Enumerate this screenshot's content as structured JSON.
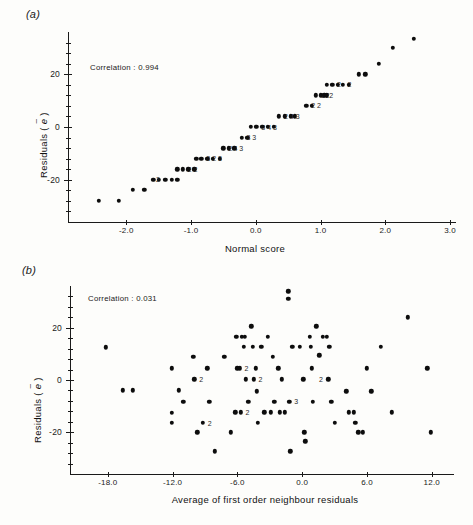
{
  "figure": {
    "background": "#fdfdfb",
    "ink": "#0d0d0d"
  },
  "panel_a": {
    "letter": "(a)",
    "annotation": "Correlation : 0.994",
    "xlabel": "Normal score",
    "ylabel_prefix": "Residuals ( ",
    "ylabel_symbol": "e",
    "ylabel_suffix": " )",
    "xticks": [
      "-2.0",
      "-1.0",
      "0.0",
      "1.0",
      "2.0",
      "3.0"
    ],
    "yticks": [
      "20",
      "0",
      "-20"
    ]
  },
  "panel_b": {
    "letter": "(b)",
    "annotation": "Correlation : 0.031",
    "xlabel": "Average of first order neighbour residuals",
    "ylabel_prefix": "Residuals ( ",
    "ylabel_symbol": "e",
    "ylabel_suffix": " )",
    "xticks": [
      "-18.0",
      "-12.0",
      "-6.0",
      "0.0",
      "6.0",
      "12.0"
    ],
    "yticks": [
      "20",
      "0",
      "-20"
    ]
  },
  "chart_data": [
    {
      "id": "panel-a",
      "type": "scatter",
      "title": "(a)",
      "xlabel": "Normal score",
      "ylabel": "Residuals (e-tilde)",
      "annotation": "Correlation : 0.994",
      "xlim": [
        -2.9,
        3.0
      ],
      "ylim": [
        -36,
        36
      ],
      "xticks": [
        -2.0,
        -1.0,
        0.0,
        1.0,
        2.0,
        3.0
      ],
      "yticks": [
        20,
        0,
        -20
      ],
      "ytick_minor_step": 4,
      "grid": false,
      "legend": null,
      "description": "Normal probability plot of residuals; points lie on a near straight line. Numeric labels beside points denote multiplicity of overplotted observations.",
      "points": [
        {
          "x": -2.42,
          "y": -28.0,
          "n": 1
        },
        {
          "x": -2.12,
          "y": -28.0,
          "n": 1
        },
        {
          "x": -1.9,
          "y": -23.8,
          "n": 1
        },
        {
          "x": -1.72,
          "y": -23.8,
          "n": 1
        },
        {
          "x": -1.58,
          "y": -20.0,
          "n": 1
        },
        {
          "x": -1.5,
          "y": -20.0,
          "n": 1
        },
        {
          "x": -1.4,
          "y": -20.0,
          "n": 2,
          "label": "2",
          "label_side": "left"
        },
        {
          "x": -1.3,
          "y": -20.0,
          "n": 1
        },
        {
          "x": -1.21,
          "y": -20.0,
          "n": 1
        },
        {
          "x": -1.21,
          "y": -16.0,
          "n": 1
        },
        {
          "x": -1.13,
          "y": -16.0,
          "n": 2,
          "label": "2",
          "label_side": "right"
        },
        {
          "x": -1.04,
          "y": -16.0,
          "n": 2,
          "label": "2",
          "label_side": "right"
        },
        {
          "x": -0.95,
          "y": -16.0,
          "n": 1
        },
        {
          "x": -0.92,
          "y": -12.0,
          "n": 1
        },
        {
          "x": -0.84,
          "y": -12.0,
          "n": 3,
          "label": "3",
          "label_side": "right"
        },
        {
          "x": -0.75,
          "y": -12.0,
          "n": 2,
          "label": "2",
          "label_side": "right"
        },
        {
          "x": -0.66,
          "y": -12.0,
          "n": 3,
          "label": "3",
          "label_side": "right"
        },
        {
          "x": -0.56,
          "y": -12.0,
          "n": 1
        },
        {
          "x": -0.5,
          "y": -8.0,
          "n": 2,
          "label": "2",
          "label_side": "right"
        },
        {
          "x": -0.42,
          "y": -8.0,
          "n": 4,
          "label": "4",
          "label_side": "right"
        },
        {
          "x": -0.33,
          "y": -8.0,
          "n": 3,
          "label": "3",
          "label_side": "right"
        },
        {
          "x": -0.22,
          "y": -4.0,
          "n": 3,
          "label": "3",
          "label_side": "right"
        },
        {
          "x": -0.13,
          "y": -4.0,
          "n": 3,
          "label": "3",
          "label_side": "right"
        },
        {
          "x": -0.08,
          "y": 0.0,
          "n": 1
        },
        {
          "x": 0.01,
          "y": 0.0,
          "n": 3,
          "label": "3",
          "label_side": "right"
        },
        {
          "x": 0.1,
          "y": 0.0,
          "n": 4,
          "label": "4",
          "label_side": "right"
        },
        {
          "x": 0.19,
          "y": 0.0,
          "n": 3,
          "label": "3",
          "label_side": "right"
        },
        {
          "x": 0.28,
          "y": 0.0,
          "n": 1
        },
        {
          "x": 0.36,
          "y": 4.0,
          "n": 2,
          "label": "2",
          "label_side": "right"
        },
        {
          "x": 0.45,
          "y": 4.0,
          "n": 4,
          "label": "4",
          "label_side": "right"
        },
        {
          "x": 0.54,
          "y": 4.0,
          "n": 3,
          "label": "3",
          "label_side": "right"
        },
        {
          "x": 0.6,
          "y": 4.0,
          "n": 1
        },
        {
          "x": 0.78,
          "y": 8.0,
          "n": 2,
          "label": "2",
          "label_side": "right"
        },
        {
          "x": 0.87,
          "y": 8.0,
          "n": 2,
          "label": "2",
          "label_side": "right"
        },
        {
          "x": 0.93,
          "y": 12.0,
          "n": 3,
          "label": "3",
          "label_side": "right"
        },
        {
          "x": 1.0,
          "y": 12.0,
          "n": 2,
          "label": "2",
          "label_side": "right"
        },
        {
          "x": 1.06,
          "y": 12.0,
          "n": 2,
          "label": "2",
          "label_side": "right"
        },
        {
          "x": 1.1,
          "y": 12.0,
          "n": 1
        },
        {
          "x": 1.1,
          "y": 16.0,
          "n": 1
        },
        {
          "x": 1.18,
          "y": 16.0,
          "n": 2,
          "label": "2",
          "label_side": "right"
        },
        {
          "x": 1.27,
          "y": 16.0,
          "n": 1
        },
        {
          "x": 1.34,
          "y": 16.0,
          "n": 2,
          "label": "2",
          "label_side": "right"
        },
        {
          "x": 1.44,
          "y": 16.0,
          "n": 1
        },
        {
          "x": 1.59,
          "y": 20.0,
          "n": 1
        },
        {
          "x": 1.69,
          "y": 20.0,
          "n": 1
        },
        {
          "x": 1.9,
          "y": 24.0,
          "n": 1
        },
        {
          "x": 2.12,
          "y": 30.0,
          "n": 1
        },
        {
          "x": 2.44,
          "y": 33.5,
          "n": 1
        }
      ]
    },
    {
      "id": "panel-b",
      "type": "scatter",
      "title": "(b)",
      "xlabel": "Average of first order neighbour residuals",
      "ylabel": "Residuals (e-tilde)",
      "annotation": "Correlation : 0.031",
      "xlim": [
        -21.5,
        13.5
      ],
      "ylim": [
        -36,
        36
      ],
      "xticks": [
        -18.0,
        -12.0,
        -6.0,
        0.0,
        6.0,
        12.0
      ],
      "yticks": [
        20,
        0,
        -20
      ],
      "ytick_minor_step": 4,
      "grid": false,
      "legend": null,
      "description": "Residuals against average of first order neighbour residuals; no apparent trend. Numeric labels beside points denote multiplicity of overplotted observations.",
      "points": [
        {
          "x": -18.2,
          "y": 12.5,
          "n": 1
        },
        {
          "x": -16.6,
          "y": -4.0,
          "n": 1
        },
        {
          "x": -15.7,
          "y": -4.0,
          "n": 1
        },
        {
          "x": -12.1,
          "y": 4.5,
          "n": 1
        },
        {
          "x": -12.1,
          "y": -12.5,
          "n": 1
        },
        {
          "x": -12.1,
          "y": -16.5,
          "n": 1
        },
        {
          "x": -11.4,
          "y": -4.0,
          "n": 1
        },
        {
          "x": -11.0,
          "y": -8.3,
          "n": 1
        },
        {
          "x": -10.1,
          "y": 8.8,
          "n": 1
        },
        {
          "x": -10.0,
          "y": 0.3,
          "n": 2,
          "label": "2",
          "label_side": "right"
        },
        {
          "x": -9.7,
          "y": -20.0,
          "n": 1
        },
        {
          "x": -9.2,
          "y": -16.5,
          "n": 2,
          "label": "2",
          "label_side": "right"
        },
        {
          "x": -8.8,
          "y": 4.5,
          "n": 1
        },
        {
          "x": -8.6,
          "y": -8.3,
          "n": 1
        },
        {
          "x": -8.1,
          "y": -27.3,
          "n": 1
        },
        {
          "x": -7.2,
          "y": 8.8,
          "n": 1
        },
        {
          "x": -6.6,
          "y": -20.0,
          "n": 1
        },
        {
          "x": -6.2,
          "y": -12.3,
          "n": 1
        },
        {
          "x": -6.1,
          "y": 16.5,
          "n": 1
        },
        {
          "x": -6.0,
          "y": 4.5,
          "n": 1
        },
        {
          "x": -5.8,
          "y": 4.5,
          "n": 2,
          "label": "2",
          "label_side": "right"
        },
        {
          "x": -5.7,
          "y": -12.3,
          "n": 2,
          "label": "2",
          "label_side": "right"
        },
        {
          "x": -5.6,
          "y": 16.5,
          "n": 1
        },
        {
          "x": -5.4,
          "y": 12.8,
          "n": 1
        },
        {
          "x": -5.3,
          "y": 16.5,
          "n": 1
        },
        {
          "x": -5.2,
          "y": 0.3,
          "n": 1
        },
        {
          "x": -5.0,
          "y": -8.3,
          "n": 1
        },
        {
          "x": -4.7,
          "y": 20.5,
          "n": 1
        },
        {
          "x": -4.6,
          "y": 12.8,
          "n": 1
        },
        {
          "x": -4.5,
          "y": 0.3,
          "n": 2,
          "label": "2",
          "label_side": "right"
        },
        {
          "x": -4.3,
          "y": 4.5,
          "n": 1
        },
        {
          "x": -4.2,
          "y": -4.3,
          "n": 1
        },
        {
          "x": -4.1,
          "y": -16.5,
          "n": 1
        },
        {
          "x": -3.8,
          "y": 12.8,
          "n": 1
        },
        {
          "x": -3.5,
          "y": -12.3,
          "n": 1
        },
        {
          "x": -3.2,
          "y": 16.5,
          "n": 1
        },
        {
          "x": -2.9,
          "y": -12.3,
          "n": 1
        },
        {
          "x": -2.7,
          "y": 8.8,
          "n": 1
        },
        {
          "x": -2.6,
          "y": -8.3,
          "n": 1
        },
        {
          "x": -2.2,
          "y": 4.5,
          "n": 1
        },
        {
          "x": -2.1,
          "y": -12.3,
          "n": 1
        },
        {
          "x": -1.9,
          "y": 0.3,
          "n": 1
        },
        {
          "x": -1.6,
          "y": -12.3,
          "n": 1
        },
        {
          "x": -1.3,
          "y": 34.0,
          "n": 1
        },
        {
          "x": -1.3,
          "y": 31.0,
          "n": 1
        },
        {
          "x": -1.2,
          "y": -8.3,
          "n": 3,
          "label": "3",
          "label_side": "right"
        },
        {
          "x": -1.1,
          "y": -27.3,
          "n": 1
        },
        {
          "x": -0.9,
          "y": 12.8,
          "n": 1
        },
        {
          "x": -0.2,
          "y": 12.8,
          "n": 1
        },
        {
          "x": 0.1,
          "y": 0.3,
          "n": 1
        },
        {
          "x": 0.2,
          "y": -20.0,
          "n": 1
        },
        {
          "x": 0.3,
          "y": -23.5,
          "n": 1
        },
        {
          "x": 0.7,
          "y": 16.5,
          "n": 1
        },
        {
          "x": 0.8,
          "y": 12.8,
          "n": 1
        },
        {
          "x": 0.9,
          "y": 4.5,
          "n": 1
        },
        {
          "x": 1.0,
          "y": -8.3,
          "n": 1
        },
        {
          "x": 1.3,
          "y": 20.5,
          "n": 1
        },
        {
          "x": 1.6,
          "y": 9.5,
          "n": 1
        },
        {
          "x": 1.9,
          "y": 16.5,
          "n": 1
        },
        {
          "x": 2.3,
          "y": 16.5,
          "n": 1
        },
        {
          "x": 2.4,
          "y": 0.3,
          "n": 2,
          "label": "2",
          "label_side": "left"
        },
        {
          "x": 2.5,
          "y": 12.8,
          "n": 1
        },
        {
          "x": 2.7,
          "y": -8.3,
          "n": 1
        },
        {
          "x": 3.0,
          "y": -16.5,
          "n": 1
        },
        {
          "x": 4.1,
          "y": -4.3,
          "n": 1
        },
        {
          "x": 4.3,
          "y": -12.3,
          "n": 1
        },
        {
          "x": 4.8,
          "y": -12.3,
          "n": 1
        },
        {
          "x": 4.9,
          "y": -16.5,
          "n": 1
        },
        {
          "x": 5.2,
          "y": -20.0,
          "n": 1
        },
        {
          "x": 5.6,
          "y": -20.0,
          "n": 1
        },
        {
          "x": 6.0,
          "y": 4.5,
          "n": 1
        },
        {
          "x": 6.4,
          "y": -4.3,
          "n": 1
        },
        {
          "x": 7.3,
          "y": 12.8,
          "n": 1
        },
        {
          "x": 8.3,
          "y": -12.3,
          "n": 1
        },
        {
          "x": 9.8,
          "y": 24.0,
          "n": 1
        },
        {
          "x": 11.6,
          "y": 4.5,
          "n": 1
        },
        {
          "x": 11.9,
          "y": -20.0,
          "n": 1
        }
      ]
    }
  ]
}
